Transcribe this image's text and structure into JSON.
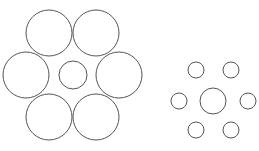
{
  "diagram": {
    "stroke_color": "#555555",
    "background": "#ffffff",
    "groups": [
      {
        "name": "large-surround-group",
        "center": {
          "cx": 73,
          "cy": 75,
          "r": 14
        },
        "surround": [
          {
            "cx": 49,
            "cy": 33,
            "r": 23
          },
          {
            "cx": 96,
            "cy": 33,
            "r": 23
          },
          {
            "cx": 26,
            "cy": 75,
            "r": 23
          },
          {
            "cx": 119,
            "cy": 75,
            "r": 23
          },
          {
            "cx": 49,
            "cy": 117,
            "r": 23
          },
          {
            "cx": 96,
            "cy": 117,
            "r": 23
          }
        ]
      },
      {
        "name": "small-surround-group",
        "center": {
          "cx": 213,
          "cy": 101,
          "r": 13
        },
        "surround": [
          {
            "cx": 196,
            "cy": 70,
            "r": 8
          },
          {
            "cx": 231,
            "cy": 70,
            "r": 8
          },
          {
            "cx": 179,
            "cy": 101,
            "r": 8
          },
          {
            "cx": 248,
            "cy": 101,
            "r": 8
          },
          {
            "cx": 196,
            "cy": 130,
            "r": 8
          },
          {
            "cx": 231,
            "cy": 130,
            "r": 8
          }
        ]
      }
    ]
  }
}
